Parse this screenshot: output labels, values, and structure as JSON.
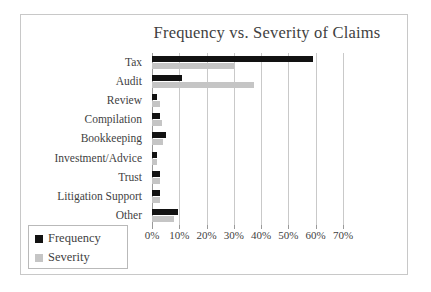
{
  "chart_data": {
    "type": "bar",
    "orientation": "horizontal",
    "title": "Frequency vs. Severity of Claims",
    "xlabel": "",
    "ylabel": "",
    "categories": [
      "Tax",
      "Audit",
      "Review",
      "Compilation",
      "Bookkeeping",
      "Investment/Advice",
      "Trust",
      "Litigation Support",
      "Other"
    ],
    "series": [
      {
        "name": "Frequency",
        "color": "#121212",
        "values": [
          59,
          11,
          2,
          3,
          5,
          2,
          3,
          3,
          9.5
        ]
      },
      {
        "name": "Severity",
        "color": "#c5c5c5",
        "values": [
          30,
          37.5,
          3,
          3.5,
          4,
          2,
          3,
          3,
          8
        ]
      }
    ],
    "xlim": [
      0,
      70
    ],
    "xtick_values": [
      0,
      10,
      20,
      30,
      40,
      50,
      60,
      70
    ],
    "xtick_labels": [
      "0%",
      "10%",
      "20%",
      "30%",
      "40%",
      "50%",
      "60%",
      "70%"
    ],
    "grid": true,
    "grid_axis": "x",
    "legend_position": "bottom-left",
    "value_format": "percent"
  },
  "legend": {
    "items": [
      {
        "label": "Frequency",
        "color": "#121212"
      },
      {
        "label": "Severity",
        "color": "#c5c5c5"
      }
    ]
  },
  "colors": {
    "frequency": "#121212",
    "severity": "#c5c5c5",
    "gridline": "#c9c9c9",
    "axis": "#9a9a9a",
    "border": "#c8c8c8",
    "text": "#3f3f3f",
    "background": "#ffffff"
  }
}
